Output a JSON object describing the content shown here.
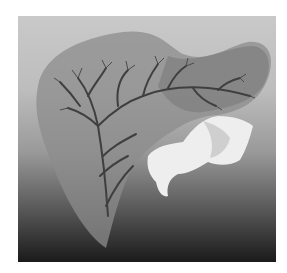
{
  "image": {
    "description": "Grayscale 3D volume rendering of a liver with internal vascular tree and an adjacent vertebra",
    "colors": {
      "background_top": "#c9c9c9",
      "background_bottom": "#1a1a1a",
      "organ": "#8a8a8a",
      "vessels": "#4a4a4a",
      "bone": "#eeeeee",
      "page": "#ffffff"
    },
    "objects": [
      {
        "name": "liver",
        "shading": "translucent gray"
      },
      {
        "name": "vessel-tree",
        "shading": "dark gray branching"
      },
      {
        "name": "vertebra",
        "shading": "white/bright"
      }
    ]
  }
}
